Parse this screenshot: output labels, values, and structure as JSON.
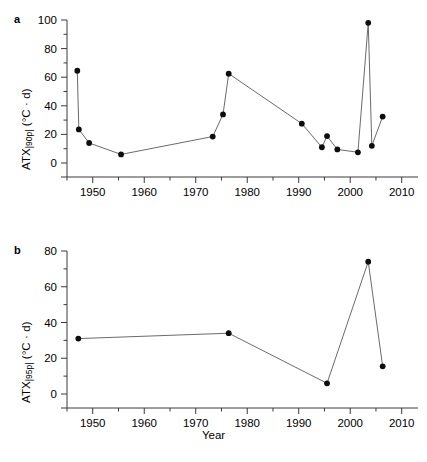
{
  "figure": {
    "xlabel": "Year",
    "panels": [
      {
        "letter": "a",
        "ylabel_main": "ATX",
        "ylabel_sub": "|90p|",
        "ylabel_unit": " (°C · d)"
      },
      {
        "letter": "b",
        "ylabel_main": "ATX",
        "ylabel_sub": "|95p|",
        "ylabel_unit": " (°C · d)"
      }
    ]
  },
  "chart_data": [
    {
      "type": "line",
      "panel": "a",
      "title": "",
      "xlabel": "",
      "ylabel": "ATX|90p| (°C · d)",
      "xlim": [
        1945,
        2012
      ],
      "ylim": [
        0,
        100
      ],
      "xticks": [
        1950,
        1960,
        1970,
        1980,
        1990,
        2000,
        2010
      ],
      "xticklabels": [
        "1950",
        "1960",
        "1970",
        "1980",
        "1990",
        "2000",
        "2010"
      ],
      "xminorticks": [
        1945,
        1955,
        1965,
        1975,
        1985,
        1995,
        2005
      ],
      "yticks": [
        0,
        20,
        40,
        60,
        80,
        100
      ],
      "yticklabels": [
        "0",
        "20",
        "40",
        "60",
        "80",
        "100"
      ],
      "yminorticks": [
        10,
        30,
        50,
        70,
        90
      ],
      "grid": false,
      "legend": false,
      "marker": "filled-circle",
      "x": [
        1947.0,
        1947.3,
        1949.3,
        1955.5,
        1973.3,
        1975.3,
        1976.4,
        1990.6,
        1994.5,
        1995.5,
        1997.5,
        2001.5,
        2003.5,
        2004.2,
        2006.3
      ],
      "y": [
        64.5,
        23.5,
        14.0,
        6.0,
        18.5,
        34.0,
        62.5,
        27.5,
        11.0,
        18.8,
        9.5,
        7.5,
        98.0,
        12.0,
        32.5
      ]
    },
    {
      "type": "line",
      "panel": "b",
      "title": "",
      "xlabel": "Year",
      "ylabel": "ATX|95p| (°C · d)",
      "xlim": [
        1945,
        2012
      ],
      "ylim": [
        0,
        80
      ],
      "xticks": [
        1950,
        1960,
        1970,
        1980,
        1990,
        2000,
        2010
      ],
      "xticklabels": [
        "1950",
        "1960",
        "1970",
        "1980",
        "1990",
        "2000",
        "2010"
      ],
      "xminorticks": [
        1945,
        1955,
        1965,
        1975,
        1985,
        1995,
        2005
      ],
      "yticks": [
        0,
        20,
        40,
        60,
        80
      ],
      "yticklabels": [
        "0",
        "20",
        "40",
        "60",
        "80"
      ],
      "yminorticks": [
        10,
        30,
        50,
        70
      ],
      "grid": false,
      "legend": false,
      "marker": "filled-circle",
      "x": [
        1947.2,
        1976.4,
        1995.5,
        2003.5,
        2006.3
      ],
      "y": [
        31.0,
        34.0,
        6.0,
        74.0,
        15.5
      ]
    }
  ]
}
